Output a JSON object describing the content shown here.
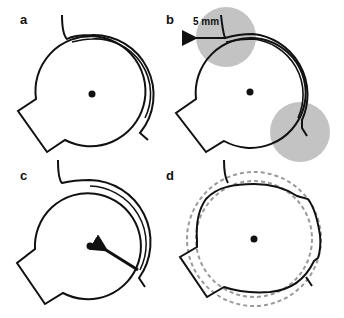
{
  "figure": {
    "panels": [
      {
        "id": "a",
        "label": "a"
      },
      {
        "id": "b",
        "label": "b",
        "scale_annotation": "5 mm"
      },
      {
        "id": "c",
        "label": "c"
      },
      {
        "id": "d",
        "label": "d"
      }
    ]
  },
  "colors": {
    "stroke": "#111111",
    "shade": "#bdbdbd",
    "dashed": "#9a9a9a",
    "background": "#ffffff"
  }
}
